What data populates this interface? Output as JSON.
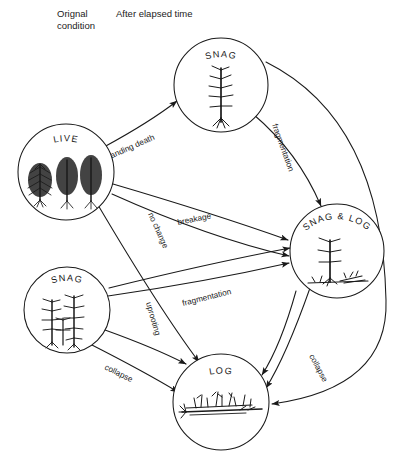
{
  "diagram": {
    "background": "#ffffff",
    "ink": "#1a1a1a"
  },
  "headers": {
    "left": "Orignal\ncondition",
    "right": "After elapsed time"
  },
  "nodes": [
    {
      "id": "live",
      "label": "LIVE",
      "cx": 66,
      "cy": 172,
      "r": 48,
      "art": "live-trees",
      "column": "original"
    },
    {
      "id": "snag_top",
      "label": "SNAG",
      "cx": 221,
      "cy": 85,
      "r": 47,
      "art": "single-dead-tree",
      "column": "elapsed"
    },
    {
      "id": "snaglog",
      "label": "SNAG & LOG",
      "cx": 337,
      "cy": 251,
      "r": 47,
      "art": "broken-snag-logs",
      "column": "elapsed"
    },
    {
      "id": "snag_bot",
      "label": "SNAG",
      "cx": 67,
      "cy": 310,
      "r": 43,
      "art": "multi-dead-trees",
      "column": "original"
    },
    {
      "id": "log",
      "label": "LOG",
      "cx": 221,
      "cy": 402,
      "r": 48,
      "art": "ground-logs",
      "column": "elapsed"
    }
  ],
  "edges": [
    {
      "id": "e1",
      "from": "live",
      "to": "snag_top",
      "label": "standing death",
      "label_rotation": -24
    },
    {
      "id": "e2",
      "from": "live",
      "to": "snaglog",
      "label": "breakage",
      "label_rotation": -11
    },
    {
      "id": "e3",
      "from": "live",
      "to": "log",
      "label": "no change",
      "label_rotation": 66
    },
    {
      "id": "e4",
      "from": "snag_top",
      "to": "snaglog",
      "label": "fragmentation",
      "label_rotation": 70
    },
    {
      "id": "e5",
      "from": "snag_top",
      "to": "log",
      "label": "",
      "label_rotation": 0
    },
    {
      "id": "e6",
      "from": "snag_bot",
      "to": "snaglog",
      "label": "fragmentation",
      "label_rotation": -14
    },
    {
      "id": "e7",
      "from": "snag_bot",
      "to": "log",
      "label": "collapse",
      "label_rotation": 26
    },
    {
      "id": "e8",
      "from": "snag_bot",
      "to": "log",
      "label": "uprooting",
      "label_rotation": 74
    },
    {
      "id": "e9",
      "from": "snaglog",
      "to": "log",
      "label": "collapse",
      "label_rotation": 62
    }
  ]
}
